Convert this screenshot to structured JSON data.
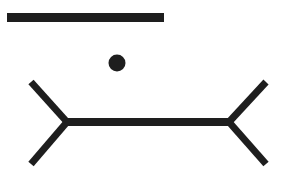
{
  "figure": {
    "title": "",
    "colors": {
      "ink": "#1e1e1e",
      "background": "#ffffff"
    },
    "top_line": {
      "x1": 7,
      "y1": 17.5,
      "x2": 164,
      "y2": 17.5,
      "thickness": 9
    },
    "dot": {
      "cx": 117,
      "cy": 63,
      "r": 8.5
    },
    "bottom_figure": {
      "shaft": {
        "x1": 66,
        "y1": 122,
        "x2": 230,
        "y2": 122,
        "thickness": 8
      },
      "left_fins": [
        {
          "x1": 31,
          "y1": 82,
          "x2": 67,
          "y2": 122
        },
        {
          "x1": 67,
          "y1": 122,
          "x2": 31,
          "y2": 164
        }
      ],
      "right_fins": [
        {
          "x1": 266,
          "y1": 82,
          "x2": 229,
          "y2": 122
        },
        {
          "x1": 229,
          "y1": 122,
          "x2": 266,
          "y2": 164
        }
      ],
      "fin_thickness": 7
    }
  }
}
